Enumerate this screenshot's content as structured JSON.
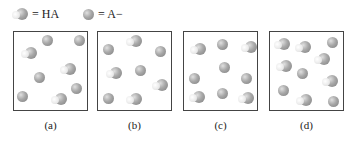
{
  "legend": {
    "ha_label": "= HA",
    "a_minus_label": "= A−"
  },
  "boxes": [
    {
      "label": "(a)",
      "ha_count": 3,
      "a_minus_count": 5
    },
    {
      "label": "(b)",
      "ha_count": 4,
      "a_minus_count": 5
    },
    {
      "label": "(c)",
      "ha_count": 4,
      "a_minus_count": 5
    },
    {
      "label": "(d)",
      "ha_count": 6,
      "a_minus_count": 5
    }
  ]
}
